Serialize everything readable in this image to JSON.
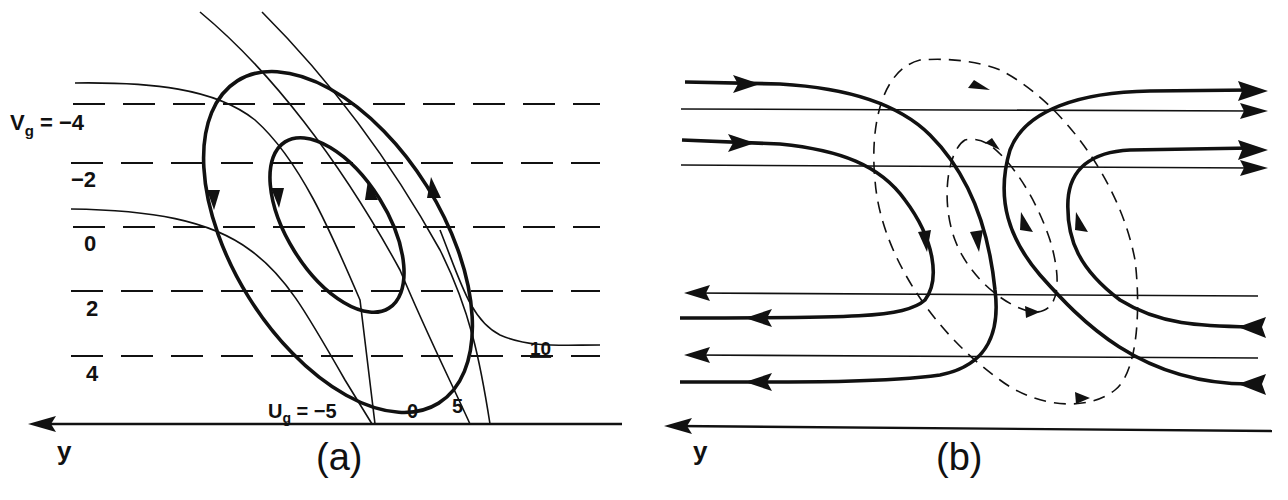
{
  "figure": {
    "panel_a": {
      "caption": "(a)",
      "axis_label": "y",
      "vg_prefix": "V",
      "vg_sub": "g",
      "vg_eq": " = ",
      "vg_values": [
        "−4",
        "−2",
        "0",
        "2",
        "4"
      ],
      "ug_prefix": "U",
      "ug_sub": "g",
      "ug_eq": " = ",
      "ug_values": [
        "−5",
        "0",
        "5",
        "10"
      ],
      "description": "Dashed horizontal lines of constant Vg; thin curves of constant Ug; thick closed elliptical orbits with arrows"
    },
    "panel_b": {
      "caption": "(b)",
      "axis_label": "y",
      "description": "Thick trajectories turning around in the frame; thin straight horizontal lines with arrows; dashed closed loops"
    }
  },
  "colors": {
    "ink": "#111111",
    "background": "#ffffff"
  }
}
